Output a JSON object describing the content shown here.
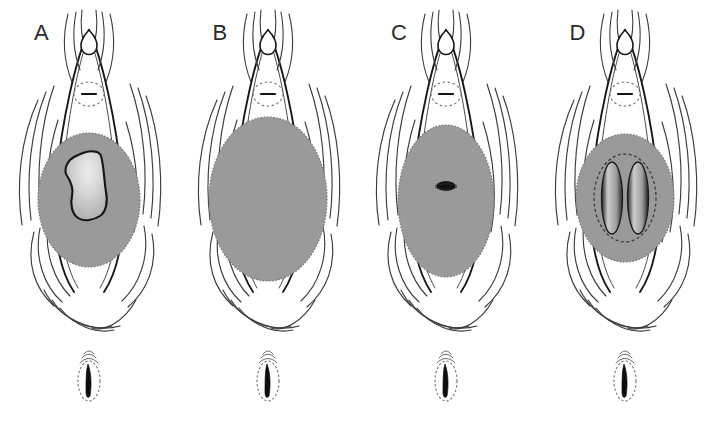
{
  "figure": {
    "kind": "anatomical-line-drawing",
    "caption": "",
    "panel_count": 4,
    "background_color": "#ffffff",
    "ink_color": "#1a1a1a",
    "line_color": "#3c3c3c",
    "fill_gray": "#9a9a9a",
    "fill_gray_dark": "#8d8d8d",
    "highlight_light": "#d8d8d8",
    "dash_color": "#6f6f6f"
  },
  "panels": [
    {
      "id": "panel-a",
      "label": "A",
      "main_fill": "#9a9a9a",
      "inner_feature": "irregular-polygon",
      "inner_fill": "#c9c9c9",
      "inset_label": "",
      "has_inset": true
    },
    {
      "id": "panel-b",
      "label": "B",
      "main_fill": "#9a9a9a",
      "inner_feature": "none",
      "inner_fill": "",
      "inset_label": "",
      "has_inset": true
    },
    {
      "id": "panel-c",
      "label": "C",
      "main_fill": "#9a9a9a",
      "inner_feature": "small-slit",
      "inner_fill": "#111111",
      "inset_label": "",
      "has_inset": true
    },
    {
      "id": "panel-d",
      "label": "D",
      "main_fill": "#9a9a9a",
      "inner_feature": "twin-lobes",
      "inner_fill": "#cfcfcf",
      "inset_label": "",
      "has_inset": true
    }
  ],
  "insets": [
    {
      "id": "inset-a",
      "shape": "dashed-ellipse-with-wedge",
      "wedge_fill": "#0d0d0d"
    },
    {
      "id": "inset-b",
      "shape": "dashed-ellipse-with-wedge",
      "wedge_fill": "#0d0d0d"
    },
    {
      "id": "inset-c",
      "shape": "dashed-ellipse-with-wedge",
      "wedge_fill": "#0d0d0d"
    },
    {
      "id": "inset-d",
      "shape": "dashed-ellipse-with-wedge",
      "wedge_fill": "#0d0d0d"
    }
  ]
}
